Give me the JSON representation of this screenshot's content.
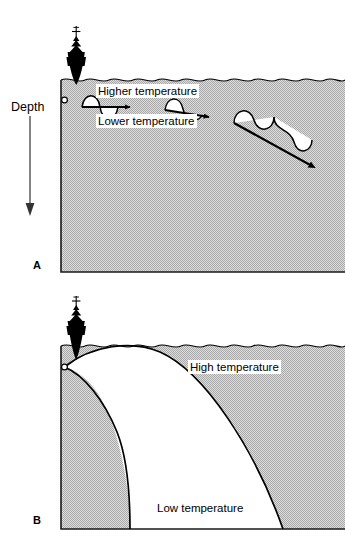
{
  "figure": {
    "depth_axis_label": "Depth",
    "colors": {
      "water_fill": "#c9c9c9",
      "line": "#000000",
      "ship": "#000000",
      "label_background": "#ffffff"
    }
  },
  "panels": [
    {
      "id": "A",
      "letter": "A",
      "description": "Shallow rays oscillating near the surface between a higher temperature layer and a lower temperature layer",
      "labels": [
        {
          "id": "higher-temperature",
          "text": "Higher temperature"
        },
        {
          "id": "lower-temperature",
          "text": "Lower temperature"
        }
      ],
      "rays": [
        {
          "id": "ray-1",
          "shape": "sine",
          "direction": "horizontal"
        },
        {
          "id": "ray-2",
          "shape": "sine",
          "direction": "slightly-downward"
        },
        {
          "id": "ray-3",
          "shape": "sine",
          "direction": "steeply-downward"
        }
      ],
      "source": {
        "id": "sound-source",
        "shape": "small-circle"
      },
      "surface": {
        "id": "sea-surface",
        "style": "wavy-line"
      }
    },
    {
      "id": "B",
      "letter": "B",
      "description": "Refracted ray envelope creating a shadow zone between high temperature surface water and low temperature deep water",
      "labels": [
        {
          "id": "high-temperature",
          "text": "High temperature"
        },
        {
          "id": "low-temperature",
          "text": "Low temperature"
        }
      ],
      "rays": [
        {
          "id": "outer-ray",
          "shape": "arc",
          "endpoint": "bottom-right"
        },
        {
          "id": "inner-ray",
          "shape": "arc",
          "endpoint": "bottom-left"
        }
      ],
      "source": {
        "id": "sound-source",
        "shape": "small-circle"
      },
      "surface": {
        "id": "sea-surface",
        "style": "wavy-line"
      }
    }
  ],
  "icons": {
    "ship": "ship-silhouette-icon",
    "depth_arrow": "down-arrow-icon",
    "source_point": "circle-marker-icon"
  }
}
